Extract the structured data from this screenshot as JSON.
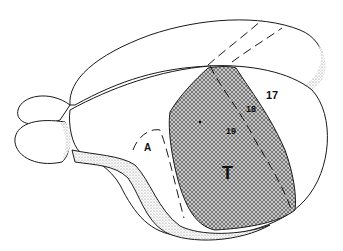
{
  "diagram": {
    "labels": {
      "area_17": "17",
      "area_18": "18",
      "area_19": "19",
      "area_t": "T",
      "area_a": "A"
    },
    "colors": {
      "line": "#1a1a1a",
      "hatch_fill": "#9a9a9a",
      "stipple": "#b8b8b8",
      "background": "#ffffff"
    }
  }
}
